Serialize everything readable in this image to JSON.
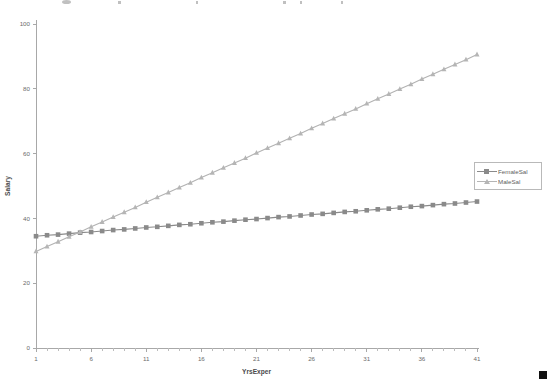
{
  "chart_data": {
    "type": "line",
    "title": "",
    "xlabel": "YrsExper",
    "ylabel": "Salary",
    "xlim": [
      1,
      41
    ],
    "ylim": [
      0,
      100
    ],
    "grid": false,
    "legend_position": "right",
    "xticks": [
      "1",
      "6",
      "11",
      "16",
      "21",
      "26",
      "31",
      "36",
      "41"
    ],
    "xtick_values": [
      1,
      6,
      11,
      16,
      21,
      26,
      31,
      36,
      41
    ],
    "yticks": [
      "0",
      "20",
      "40",
      "60",
      "80",
      "100"
    ],
    "ytick_values": [
      0,
      20,
      40,
      60,
      80,
      100
    ],
    "x": [
      1,
      2,
      3,
      4,
      5,
      6,
      7,
      8,
      9,
      10,
      11,
      12,
      13,
      14,
      15,
      16,
      17,
      18,
      19,
      20,
      21,
      22,
      23,
      24,
      25,
      26,
      27,
      28,
      29,
      30,
      31,
      32,
      33,
      34,
      35,
      36,
      37,
      38,
      39,
      40,
      41
    ],
    "series": [
      {
        "name": "FemaleSal",
        "marker": "square",
        "color": "#8a8a8a",
        "values": [
          34.5,
          34.8,
          35.0,
          35.3,
          35.6,
          35.8,
          36.1,
          36.4,
          36.6,
          36.9,
          37.2,
          37.4,
          37.7,
          38.0,
          38.2,
          38.5,
          38.8,
          39.0,
          39.3,
          39.6,
          39.8,
          40.1,
          40.4,
          40.6,
          40.9,
          41.2,
          41.4,
          41.7,
          42.0,
          42.2,
          42.5,
          42.8,
          43.0,
          43.3,
          43.6,
          43.8,
          44.1,
          44.4,
          44.6,
          44.9,
          45.2
        ]
      },
      {
        "name": "MaleSal",
        "marker": "triangle",
        "color": "#b5b5b5",
        "values": [
          29.8,
          31.3,
          32.8,
          34.3,
          35.8,
          37.4,
          38.9,
          40.4,
          41.9,
          43.4,
          45.0,
          46.5,
          48.0,
          49.5,
          51.0,
          52.6,
          54.1,
          55.6,
          57.1,
          58.6,
          60.2,
          61.7,
          63.2,
          64.7,
          66.2,
          67.8,
          69.3,
          70.8,
          72.3,
          73.8,
          75.4,
          76.9,
          78.4,
          79.9,
          81.4,
          83.0,
          84.5,
          86.0,
          87.5,
          89.0,
          90.6
        ]
      }
    ]
  },
  "legend": {
    "items": [
      {
        "label": "FemaleSal",
        "marker": "square-marker",
        "color": "#8a8a8a"
      },
      {
        "label": "MaleSal",
        "marker": "triangle-marker",
        "color": "#b5b5b5"
      }
    ]
  },
  "axes": {
    "x_title": "YrsExper",
    "y_title": "Salary"
  }
}
